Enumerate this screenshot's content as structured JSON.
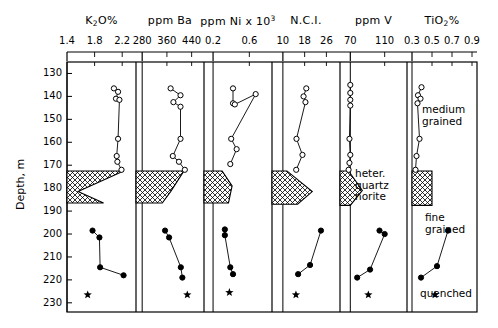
{
  "figure": {
    "y_axis_label": "Depth, m",
    "y_ticks": [
      130,
      140,
      150,
      160,
      170,
      180,
      190,
      200,
      210,
      220,
      230
    ],
    "ylim": [
      125,
      234
    ],
    "plot_top_px": 62,
    "plot_bottom_px": 312,
    "annotations": [
      {
        "name": "medium-grained",
        "lines": "medium\ngrained",
        "x": 422,
        "y": 104
      },
      {
        "name": "heter-quartz-norite",
        "lines": "heter.\nquartz\nnorite",
        "x": 355,
        "y": 168
      },
      {
        "name": "fine-grained",
        "lines": "fine\ngrained",
        "x": 425,
        "y": 212
      },
      {
        "name": "quenched",
        "lines": "quenched",
        "x": 420,
        "y": 288
      }
    ]
  },
  "chart_data": {
    "type": "line",
    "ylabel": "Depth, m",
    "ylim": [
      125,
      234
    ],
    "grid": false,
    "legend": "none",
    "marker_legend": {
      "open-circle": "medium grained unit samples",
      "filled-circle": "fine grained unit samples",
      "filled-star": "quenched margin sample",
      "hatched-block": "heterogeneous quartz norite interval"
    },
    "hatched_interval": {
      "depth_top": 172.5,
      "depth_bottom": 189.5
    },
    "panels": [
      {
        "name": "k2o",
        "title": "K₂O%",
        "title_html": "K<sub>2</sub>O%",
        "xlim": [
          1.4,
          2.4
        ],
        "xticks": [
          1.4,
          1.8,
          2.2
        ],
        "x_px": [
          67,
          136
        ],
        "series": [
          {
            "name": "medium-grained",
            "marker": "open-circle",
            "points": [
              [
                2.08,
                136.5
              ],
              [
                2.14,
                138.0
              ],
              [
                2.11,
                141.0
              ],
              [
                2.16,
                141.5
              ],
              [
                2.14,
                158.5
              ],
              [
                2.12,
                166.0
              ],
              [
                2.13,
                168.5
              ],
              [
                2.19,
                172.0
              ]
            ]
          },
          {
            "name": "fine-grained",
            "marker": "filled-circle",
            "points": [
              [
                1.77,
                198.5
              ],
              [
                1.87,
                201.5
              ],
              [
                1.88,
                214.5
              ],
              [
                2.22,
                218.0
              ]
            ]
          },
          {
            "name": "quenched",
            "marker": "filled-star",
            "points": [
              [
                1.7,
                226.5
              ]
            ]
          }
        ],
        "hatch_polygon": [
          [
            1.4,
            172.5
          ],
          [
            2.22,
            172.5
          ],
          [
            1.56,
            181.5
          ],
          [
            1.93,
            186.5
          ],
          [
            1.4,
            186.5
          ]
        ]
      },
      {
        "name": "ba",
        "title": "ppm Ba",
        "title_html": "ppm Ba",
        "xlim": [
          260,
          480
        ],
        "xticks": [
          280,
          360,
          440
        ],
        "x_px": [
          136,
          204
        ],
        "series": [
          {
            "name": "medium-grained",
            "marker": "open-circle",
            "points": [
              [
                372,
                136.5
              ],
              [
                404,
                139.5
              ],
              [
                381,
                142.5
              ],
              [
                404,
                144.5
              ],
              [
                404,
                158.5
              ],
              [
                379,
                166.0
              ],
              [
                399,
                168.5
              ],
              [
                418,
                172.0
              ]
            ]
          },
          {
            "name": "fine-grained",
            "marker": "filled-circle",
            "points": [
              [
                354,
                198.5
              ],
              [
                367,
                201.5
              ],
              [
                405,
                214.5
              ],
              [
                410,
                219.0
              ]
            ]
          },
          {
            "name": "quenched",
            "marker": "filled-star",
            "points": [
              [
                426,
                226.5
              ]
            ]
          }
        ],
        "hatch_polygon": [
          [
            260,
            172.5
          ],
          [
            415,
            172.5
          ],
          [
            372,
            181.5
          ],
          [
            345,
            186.5
          ],
          [
            260,
            186.5
          ]
        ]
      },
      {
        "name": "ni",
        "title": "ppm Ni x 10³",
        "title_html": "ppm Ni x 10<sup>3</sup>",
        "xlim": [
          0.1,
          0.85
        ],
        "xticks": [
          0.2,
          0.6
        ],
        "x_px": [
          204,
          272
        ],
        "series": [
          {
            "name": "medium-grained",
            "marker": "open-circle",
            "points": [
              [
                0.42,
                136.5
              ],
              [
                0.42,
                143.0
              ],
              [
                0.44,
                143.5
              ],
              [
                0.67,
                139.0
              ],
              [
                0.4,
                158.5
              ],
              [
                0.46,
                163.0
              ],
              [
                0.39,
                169.5
              ]
            ]
          },
          {
            "name": "fine-grained",
            "marker": "filled-circle",
            "points": [
              [
                0.33,
                198.0
              ],
              [
                0.33,
                200.5
              ],
              [
                0.39,
                214.5
              ],
              [
                0.42,
                217.5
              ]
            ]
          },
          {
            "name": "quenched",
            "marker": "filled-star",
            "points": [
              [
                0.38,
                225.5
              ]
            ]
          }
        ],
        "hatch_polygon": [
          [
            0.1,
            172.5
          ],
          [
            0.3,
            172.5
          ],
          [
            0.41,
            179.0
          ],
          [
            0.37,
            186.5
          ],
          [
            0.1,
            186.5
          ]
        ]
      },
      {
        "name": "nci",
        "title": "N.C.I.",
        "title_html": "N.C.I.",
        "xlim": [
          6,
          31
        ],
        "xticks": [
          10,
          18,
          26
        ],
        "x_px": [
          272,
          340
        ],
        "series": [
          {
            "name": "medium-grained",
            "marker": "open-circle",
            "points": [
              [
                18.6,
                136.5
              ],
              [
                17.6,
                140.0
              ],
              [
                18.3,
                142.5
              ],
              [
                15.0,
                158.5
              ],
              [
                17.2,
                165.5
              ],
              [
                14.9,
                172.0
              ]
            ]
          },
          {
            "name": "fine-grained",
            "marker": "filled-circle",
            "points": [
              [
                24.0,
                198.5
              ],
              [
                20.0,
                213.5
              ],
              [
                15.6,
                217.5
              ]
            ]
          },
          {
            "name": "quenched",
            "marker": "filled-star",
            "points": [
              [
                14.8,
                226.5
              ]
            ]
          }
        ],
        "hatch_polygon": [
          [
            6,
            172.5
          ],
          [
            11.5,
            172.5
          ],
          [
            20.8,
            181.5
          ],
          [
            15.4,
            187.0
          ],
          [
            6,
            187.0
          ]
        ]
      },
      {
        "name": "v",
        "title": "ppm V",
        "title_html": "ppm V",
        "xlim": [
          58,
          136
        ],
        "xticks": [
          70,
          110
        ],
        "x_px": [
          340,
          407
        ],
        "series": [
          {
            "name": "medium-grained",
            "marker": "open-circle",
            "points": [
              [
                70,
                135.0
              ],
              [
                70,
                138.5
              ],
              [
                70,
                141.5
              ],
              [
                70,
                144.0
              ],
              [
                69,
                158.5
              ],
              [
                70,
                165.5
              ],
              [
                69,
                169.0
              ],
              [
                68,
                172.0
              ]
            ]
          },
          {
            "name": "fine-grained",
            "marker": "filled-circle",
            "points": [
              [
                104,
                198.5
              ],
              [
                110,
                200.0
              ],
              [
                93,
                215.5
              ],
              [
                78,
                219.0
              ]
            ]
          },
          {
            "name": "quenched",
            "marker": "filled-star",
            "points": [
              [
                91,
                226.5
              ]
            ]
          }
        ],
        "hatch_polygon": [
          [
            58,
            172.5
          ],
          [
            68,
            172.5
          ],
          [
            84,
            181.0
          ],
          [
            70,
            187.5
          ],
          [
            58,
            187.5
          ]
        ]
      },
      {
        "name": "tio2",
        "title": "TiO₂%",
        "title_html": "TiO<sub>2</sub>%",
        "xlim": [
          0.25,
          0.95
        ],
        "xticks": [
          0.3,
          0.5,
          0.7,
          0.9
        ],
        "x_px": [
          407,
          477
        ],
        "series": [
          {
            "name": "medium-grained",
            "marker": "open-circle",
            "points": [
              [
                0.395,
                136.0
              ],
              [
                0.36,
                139.5
              ],
              [
                0.385,
                141.0
              ],
              [
                0.355,
                143.0
              ],
              [
                0.375,
                158.5
              ],
              [
                0.345,
                166.0
              ],
              [
                0.335,
                172.0
              ]
            ]
          },
          {
            "name": "fine-grained",
            "marker": "filled-circle",
            "points": [
              [
                0.66,
                198.5
              ],
              [
                0.55,
                214.0
              ],
              [
                0.39,
                219.0
              ]
            ]
          },
          {
            "name": "quenched",
            "marker": "filled-star",
            "points": [
              [
                0.53,
                226.5
              ]
            ]
          }
        ],
        "hatch_polygon": [
          [
            0.3,
            172.5
          ],
          [
            0.5,
            172.5
          ],
          [
            0.5,
            187.5
          ],
          [
            0.3,
            187.5
          ]
        ]
      }
    ]
  }
}
